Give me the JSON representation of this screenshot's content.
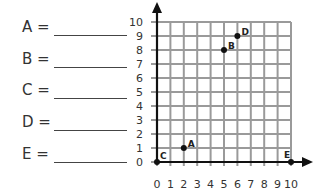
{
  "answers": [
    {
      "letter": "A",
      "label": "A =",
      "value": ""
    },
    {
      "letter": "B",
      "label": "B =",
      "value": ""
    },
    {
      "letter": "C",
      "label": "C =",
      "value": ""
    },
    {
      "letter": "D",
      "label": "D =",
      "value": ""
    },
    {
      "letter": "E",
      "label": "E =",
      "value": ""
    }
  ],
  "grid": {
    "x_ticks": [
      "0",
      "1",
      "2",
      "3",
      "4",
      "5",
      "6",
      "7",
      "8",
      "9",
      "10"
    ],
    "y_ticks": [
      "0",
      "1",
      "2",
      "3",
      "4",
      "5",
      "6",
      "7",
      "8",
      "9",
      "10"
    ],
    "xlim": [
      0,
      10
    ],
    "ylim": [
      0,
      10
    ],
    "grid_color": "#9a9a9a",
    "axis_color": "#111111"
  },
  "points": [
    {
      "name": "A",
      "x": 2,
      "y": 1
    },
    {
      "name": "B",
      "x": 5,
      "y": 8
    },
    {
      "name": "C",
      "x": 0,
      "y": 0
    },
    {
      "name": "D",
      "x": 6,
      "y": 9
    },
    {
      "name": "E",
      "x": 10,
      "y": 0
    }
  ]
}
